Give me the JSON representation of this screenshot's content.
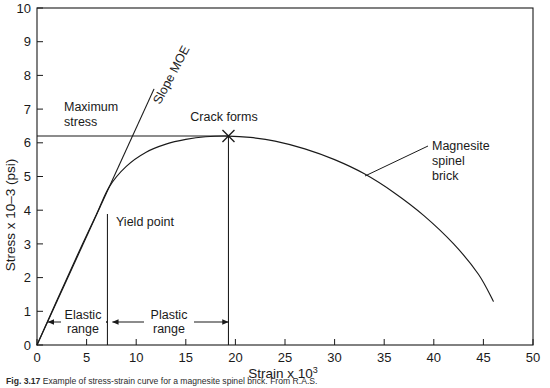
{
  "figure": {
    "caption_prefix": "Fig. 3.17",
    "caption_body": "Example of stress-strain curve for a magnesite spinel brick. From R.A.S.",
    "axis_color": "#1a1a1a",
    "curve_color": "#1a1a1a",
    "background": "#ffffff"
  },
  "chart_data": {
    "type": "line",
    "title": "",
    "xlabel_main": "Strain x 10",
    "xlabel_exp": "3",
    "ylabel_main": "Stress x 10–3 (psi)",
    "xlim": [
      0,
      50
    ],
    "ylim": [
      0,
      10
    ],
    "xticks": [
      0,
      5,
      10,
      15,
      20,
      25,
      30,
      35,
      40,
      45,
      50
    ],
    "yticks": [
      0,
      1,
      2,
      3,
      4,
      5,
      6,
      7,
      8,
      9,
      10
    ],
    "xtick_labels": [
      "0",
      "5",
      "10",
      "15",
      "20",
      "25",
      "30",
      "35",
      "40",
      "45",
      "50"
    ],
    "ytick_labels": [
      "0",
      "1",
      "2",
      "3",
      "4",
      "5",
      "6",
      "7",
      "8",
      "9",
      "10"
    ],
    "grid": false,
    "legend": "none",
    "series": [
      {
        "name": "Magnesite spinel brick stress-strain curve",
        "points": [
          [
            0.0,
            0.0
          ],
          [
            2.0,
            1.32
          ],
          [
            4.0,
            2.62
          ],
          [
            6.0,
            3.88
          ],
          [
            7.3,
            4.7
          ],
          [
            9.0,
            5.3
          ],
          [
            11.0,
            5.72
          ],
          [
            13.0,
            5.96
          ],
          [
            15.0,
            6.1
          ],
          [
            17.0,
            6.18
          ],
          [
            19.3,
            6.2
          ],
          [
            21.5,
            6.16
          ],
          [
            24.0,
            6.05
          ],
          [
            27.0,
            5.82
          ],
          [
            30.0,
            5.5
          ],
          [
            33.0,
            5.08
          ],
          [
            36.0,
            4.52
          ],
          [
            39.0,
            3.84
          ],
          [
            42.0,
            3.0
          ],
          [
            44.5,
            2.1
          ],
          [
            46.0,
            1.3
          ]
        ]
      },
      {
        "name": "Slope MOE tangent line",
        "points": [
          [
            0.0,
            0.0
          ],
          [
            11.8,
            7.6
          ]
        ]
      }
    ],
    "annotations": [
      {
        "key": "maximum_stress",
        "label_line1": "Maximum",
        "label_line2": "stress",
        "value_y": 6.2,
        "marker": "horizontal-line"
      },
      {
        "key": "slope_moe",
        "label": "Slope MOE",
        "marker": "rotated-line-label"
      },
      {
        "key": "crack_forms",
        "label": "Crack forms",
        "value_x": 19.3,
        "value_y": 6.2,
        "marker": "x-cross"
      },
      {
        "key": "yield_point",
        "label": "Yield point",
        "value_x": 7.1,
        "marker": "vertical-line"
      },
      {
        "key": "elastic_range",
        "label_line1": "Elastic",
        "label_line2": "range",
        "range_x": [
          1.1,
          7.1
        ],
        "marker": "double-arrow"
      },
      {
        "key": "plastic_range",
        "label_line1": "Plastic",
        "label_line2": "range",
        "range_x": [
          7.6,
          19.3
        ],
        "marker": "double-arrow"
      },
      {
        "key": "material_label",
        "label_line1": "Magnesite",
        "label_line2": "spinel",
        "label_line3": "brick",
        "marker": "leader-line",
        "anchor_x": 32.5,
        "anchor_y": 5.2
      }
    ]
  }
}
